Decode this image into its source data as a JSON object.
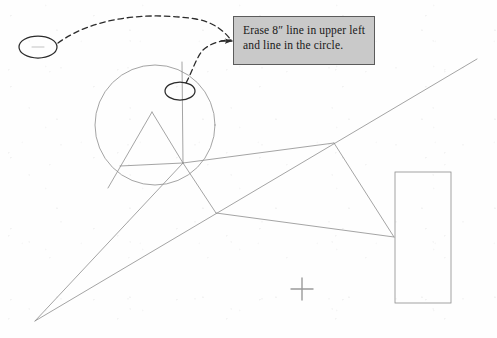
{
  "document": {
    "kind": "scanned-markup-drawing",
    "sheet_width": 497,
    "sheet_height": 338,
    "paper_color": "#fefefe",
    "ink_color": "#6e6e6e"
  },
  "callout": {
    "name": "erase-instruction-note",
    "line1": "Erase 8″ line in upper left",
    "line2": "and line in the circle.",
    "fill_color": "#c9c9c9",
    "border_color": "#5b5b5b",
    "text_color": "#181818",
    "box": {
      "x": 233,
      "y": 16,
      "width": 142,
      "height": 49
    }
  },
  "markup": {
    "ink_color": "#2b2b2b",
    "leader_style": "dashed",
    "arrowhead_at": {
      "x": 233,
      "y": 41
    },
    "ellipses": [
      {
        "name": "upper-left-circled-line",
        "cx": 38,
        "cy": 47,
        "rx": 19,
        "ry": 11,
        "note": "circles the 8-inch line in upper left"
      },
      {
        "name": "circle-interior-circled-line",
        "cx": 180,
        "cy": 91,
        "rx": 15,
        "ry": 9,
        "note": "circles the vertical line inside the big circle"
      }
    ],
    "leaders": [
      {
        "name": "leader-from-upper-left-ellipse",
        "from": [
          57,
          44
        ],
        "to": [
          233,
          41
        ]
      },
      {
        "name": "leader-from-circle-ellipse",
        "from": [
          181,
          82
        ],
        "to": [
          233,
          41
        ]
      }
    ],
    "crosshair": {
      "name": "registration-crosshair",
      "cx": 302,
      "cy": 289,
      "size": 11
    }
  },
  "geometry": {
    "line_color": "#8d8d8d",
    "stroke_width": 0.8,
    "circle": {
      "name": "main-circle",
      "cx": 155,
      "cy": 125,
      "r": 60
    },
    "rectangle": {
      "name": "right-rectangle",
      "x": 395,
      "y": 172,
      "width": 56,
      "height": 131
    },
    "vertical_line": {
      "name": "circle-vertical-line",
      "x": 182,
      "y1": 62,
      "y2": 163
    },
    "apex": {
      "name": "triangle-apex",
      "x": 152,
      "y": 112
    },
    "hub_upper": {
      "name": "upper-hub-node",
      "x": 183,
      "y": 163
    },
    "hub_lower": {
      "name": "lower-hub-node",
      "x": 216,
      "y": 213
    },
    "hub_right": {
      "name": "rectangle-contact-node",
      "x": 394,
      "y": 237
    },
    "node_mid_right": {
      "name": "mid-right-node",
      "x": 334,
      "y": 143
    },
    "apex_bottom_left": {
      "name": "bottom-left-vertex",
      "x": 35,
      "y": 321
    },
    "diagonal_end": {
      "name": "long-diagonal-top-right",
      "x": 477,
      "y": 59
    },
    "circle_left_node": {
      "name": "circle-left-intersect",
      "x": 125,
      "y": 163
    }
  }
}
